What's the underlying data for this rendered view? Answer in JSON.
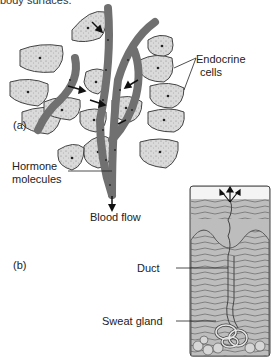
{
  "caption_fragment": "body surfaces.",
  "panel_a": {
    "label": "(a)",
    "endocrine_label_line1": "Endocrine",
    "endocrine_label_line2": "cells",
    "hormone_label_line1": "Hormone",
    "hormone_label_line2": "molecules",
    "blood_flow_label": "Blood flow"
  },
  "panel_b": {
    "label": "(b)",
    "duct_label": "Duct",
    "sweat_gland_label": "Sweat gland"
  },
  "colors": {
    "vessel": "#707070",
    "cell_fill": "#d9d9d9",
    "cell_stroke": "#444444",
    "skin_fill": "#b5b5b5",
    "epidermis_top": "#e8e8e8",
    "text": "#222222"
  }
}
